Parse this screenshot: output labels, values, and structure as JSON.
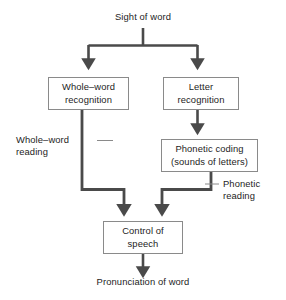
{
  "diagram": {
    "title_text": "Sight of word",
    "outcome_text": "Pronunciation of word",
    "stroke_color": "#4a4a4a",
    "box_border_color": "#8a8a8a",
    "text_color": "#1d1d1d",
    "background_color": "#ffffff",
    "nodes": [
      {
        "id": "whole-word-recognition",
        "line1": "Whole–word",
        "line2": "recognition"
      },
      {
        "id": "letter-recognition",
        "line1": "Letter",
        "line2": "recognition"
      },
      {
        "id": "phonetic-coding",
        "line1": "Phonetic coding",
        "line2": "(sounds of letters)"
      },
      {
        "id": "control-of-speech",
        "line1": "Control of",
        "line2": "speech"
      }
    ],
    "path_labels": [
      {
        "id": "whole-word-reading",
        "line1": "Whole–word",
        "line2": "reading"
      },
      {
        "id": "phonetic-reading",
        "line1": "Phonetic",
        "line2": "reading"
      }
    ]
  }
}
